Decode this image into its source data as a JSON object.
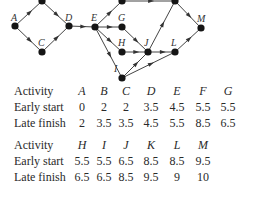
{
  "diagram": {
    "nodes": [
      {
        "id": "A",
        "label": "A",
        "x": 15,
        "y": 26,
        "lx": 14,
        "ly": 21
      },
      {
        "id": "B",
        "label": "",
        "x": 42,
        "y": 1
      },
      {
        "id": "C",
        "label": "C",
        "x": 42,
        "y": 52,
        "lx": 41,
        "ly": 46
      },
      {
        "id": "D",
        "label": "D",
        "x": 69,
        "y": 26,
        "lx": 68,
        "ly": 21
      },
      {
        "id": "E",
        "label": "E",
        "x": 95,
        "y": 27,
        "lx": 94,
        "ly": 21
      },
      {
        "id": "F",
        "label": "",
        "x": 122,
        "y": 1
      },
      {
        "id": "G",
        "label": "G",
        "x": 122,
        "y": 27,
        "lx": 121,
        "ly": 21
      },
      {
        "id": "H",
        "label": "H",
        "x": 122,
        "y": 52,
        "lx": 121,
        "ly": 46
      },
      {
        "id": "I",
        "label": "I",
        "x": 122,
        "y": 78,
        "lx": 117,
        "ly": 72
      },
      {
        "id": "J",
        "label": "J",
        "x": 148,
        "y": 52,
        "lx": 147,
        "ly": 46
      },
      {
        "id": "K",
        "label": "",
        "x": 175,
        "y": 1
      },
      {
        "id": "L",
        "label": "L",
        "x": 175,
        "y": 52,
        "lx": 174,
        "ly": 46
      },
      {
        "id": "M",
        "label": "M",
        "x": 201,
        "y": 28,
        "lx": 200,
        "ly": 22
      }
    ],
    "edges": [
      [
        "A",
        "B"
      ],
      [
        "A",
        "C"
      ],
      [
        "B",
        "D"
      ],
      [
        "C",
        "D"
      ],
      [
        "D",
        "E"
      ],
      [
        "E",
        "F"
      ],
      [
        "E",
        "G"
      ],
      [
        "E",
        "H"
      ],
      [
        "E",
        "I"
      ],
      [
        "F",
        "K"
      ],
      [
        "G",
        "J"
      ],
      [
        "H",
        "J"
      ],
      [
        "I",
        "J"
      ],
      [
        "I",
        "L"
      ],
      [
        "J",
        "K"
      ],
      [
        "J",
        "L"
      ],
      [
        "K",
        "M"
      ],
      [
        "L",
        "M"
      ]
    ]
  },
  "tables": [
    {
      "header_label": "Activity",
      "activities": [
        "A",
        "B",
        "C",
        "D",
        "E",
        "F",
        "G"
      ],
      "rows": [
        {
          "label": "Early start",
          "values": [
            "0",
            "2",
            "2",
            "3.5",
            "4.5",
            "5.5",
            "5.5"
          ]
        },
        {
          "label": "Late finish",
          "values": [
            "2",
            "3.5",
            "3.5",
            "4.5",
            "5.5",
            "8.5",
            "6.5"
          ]
        }
      ]
    },
    {
      "header_label": "Activity",
      "activities": [
        "H",
        "I",
        "J",
        "K",
        "L",
        "M"
      ],
      "rows": [
        {
          "label": "Early start",
          "values": [
            "5.5",
            "5.5",
            "6.5",
            "8.5",
            "8.5",
            "9.5"
          ]
        },
        {
          "label": "Late finish",
          "values": [
            "6.5",
            "6.5",
            "8.5",
            "9.5",
            "9",
            "10"
          ]
        }
      ]
    }
  ]
}
